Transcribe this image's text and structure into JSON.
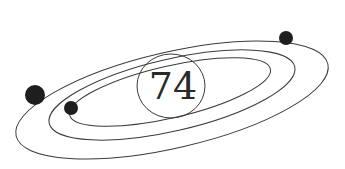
{
  "diagram": {
    "center_label": "74",
    "orbits": 3,
    "planets": 3,
    "colors": {
      "line": "#3a3a3a",
      "planet": "#1e1e1e",
      "background": "#ffffff"
    }
  }
}
